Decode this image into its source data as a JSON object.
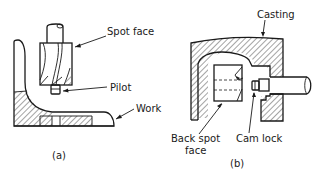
{
  "figure_a": {
    "caption": "(a)",
    "labels": {
      "spot_face": "Spot face",
      "pilot": "Pilot",
      "work": "Work"
    }
  },
  "figure_b": {
    "caption": "(b)",
    "labels": {
      "casting": "Casting",
      "back_spot_face_line1": "Back spot",
      "back_spot_face_line2": "face",
      "cam_lock": "Cam lock"
    }
  },
  "colors": {
    "line": "#1a1a1a",
    "background": "#ffffff"
  }
}
